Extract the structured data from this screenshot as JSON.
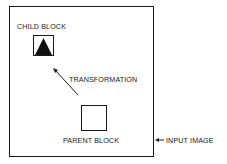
{
  "labels": {
    "child_block": "CHILD BLOCK",
    "transformation": "TRANSFORMATION",
    "parent_block": "PARENT BLOCK",
    "input_image": "INPUT IMAGE"
  },
  "colors": {
    "stroke": "#1a1a1a",
    "background": "#ffffff"
  }
}
